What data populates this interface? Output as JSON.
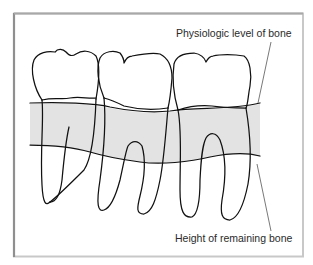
{
  "figure": {
    "type": "dental-illustration",
    "colors": {
      "frame_left": "#8a8a8a",
      "frame_other": "#c8c8c8",
      "bone_band": "#e3e3e3",
      "outline": "#111111",
      "leader_line": "#555555",
      "label_text": "#2a2a2a"
    }
  },
  "labels": {
    "physiologic": "Physiologic level of bone",
    "remaining": "Height of remaining bone"
  }
}
